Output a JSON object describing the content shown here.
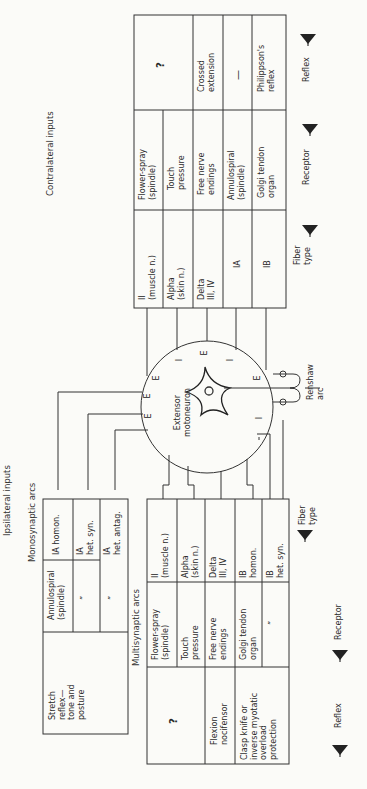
{
  "figure": {
    "orientation": "rotated 90° counter-clockwise",
    "center": {
      "label_line1": "Extensor",
      "label_line2": "motoneuron",
      "synapse_marks_top": [
        "E",
        "I",
        "E",
        "I",
        "E",
        "E"
      ],
      "synapse_marks_bottom": [
        "E",
        "E",
        "I",
        "I",
        "I",
        "I",
        "I",
        "E",
        "I"
      ],
      "renshaw_label_line1": "Renshaw",
      "renshaw_label_line2": "arc"
    },
    "contralateral": {
      "title": "Contralateral inputs",
      "columns": [
        "Fiber type",
        "Receptor",
        "Reflex"
      ],
      "rows": [
        {
          "fiber": "II\n(muscle n.)",
          "receptor": "Flower-spray\n(spindle)",
          "reflex": "?"
        },
        {
          "fiber": "Alpha\n(skin n.)",
          "receptor": "Touch\npressure",
          "reflex": "?"
        },
        {
          "fiber": "Delta\nIII, IV",
          "receptor": "Free nerve\nendings",
          "reflex": "Crossed\nextension"
        },
        {
          "fiber": "IA",
          "receptor": "Annulospiral\n(spindle)",
          "reflex": "—"
        },
        {
          "fiber": "IB",
          "receptor": "Golgi tendon\norgan",
          "reflex": "Philippson's\nreflex"
        }
      ],
      "arrow_labels": {
        "fiber": "Fiber\ntype",
        "receptor": "Receptor",
        "reflex": "Reflex"
      }
    },
    "ipsilateral": {
      "title": "Ipsilateral inputs",
      "monosynaptic": {
        "title": "Monosynaptic arcs",
        "reflex": "Stretch\nreflex—\ntone and\nposture",
        "rows": [
          {
            "receptor": "Annulospiral\n(spindle)",
            "fiber": "IA homon."
          },
          {
            "receptor": "”",
            "fiber": "IA\nhet. syn."
          },
          {
            "receptor": "”",
            "fiber": "IA\nhet. antag."
          }
        ]
      },
      "multisynaptic": {
        "title": "Multisynaptic arcs",
        "reflexes": [
          "?",
          "Flexion\nnocifensor",
          "Clasp knife or\ninverse myotatic\noverload\nprotection"
        ],
        "rows": [
          {
            "receptor": "Flower-spray\n(spindle)",
            "fiber": "II\n(muscle n.)"
          },
          {
            "receptor": "Touch\npressure",
            "fiber": "Alpha\n(skin n.)"
          },
          {
            "receptor": "Free nerve\nendings",
            "fiber": "Delta\nIII, IV"
          },
          {
            "receptor": "Golgi tendon\norgan",
            "fiber": "IB\nhomon."
          },
          {
            "receptor": "”",
            "fiber": "IB\nhet. syn."
          },
          {
            "receptor": "”",
            "fiber": "IB\nhet. antag."
          }
        ]
      },
      "arrow_labels": {
        "reflex": "Reflex",
        "receptor": "Receptor",
        "fiber": "Fiber\ntype"
      }
    }
  }
}
